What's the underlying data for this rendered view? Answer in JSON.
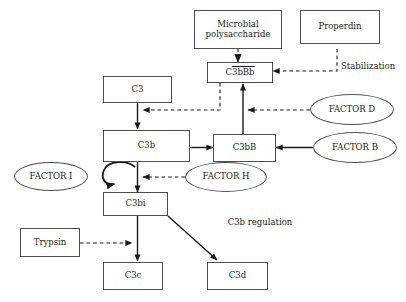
{
  "diagram": {
    "background_color": "#ffffff",
    "stroke_color": "#4d4d4d",
    "arrow_color": "#1a1a1a",
    "text_color": "#1a1a1a"
  },
  "nodes": {
    "microbial_polysaccharide": {
      "label_line1": "Microbial",
      "label_line2": "polysaccharide",
      "shape": "box"
    },
    "properdin": {
      "label": "Properdin",
      "shape": "box"
    },
    "c3bbb": {
      "label_prefix": "C",
      "label_overline": "3bBb",
      "shape": "box"
    },
    "c3": {
      "label": "C3",
      "shape": "box"
    },
    "c3b": {
      "label": "C3b",
      "shape": "box"
    },
    "c3bb": {
      "label": "C3bB",
      "shape": "box"
    },
    "c3bi": {
      "label": "C3bi",
      "shape": "box"
    },
    "trypsin": {
      "label": "Trypsin",
      "shape": "box"
    },
    "c3c": {
      "label": "C3c",
      "shape": "box"
    },
    "c3d": {
      "label": "C3d",
      "shape": "box"
    },
    "factor_d": {
      "label": "FACTOR D",
      "shape": "ellipse"
    },
    "factor_b": {
      "label": "FACTOR B",
      "shape": "ellipse"
    },
    "factor_h": {
      "label": "FACTOR H",
      "shape": "ellipse"
    },
    "factor_i": {
      "label": "FACTOR I",
      "shape": "ellipse"
    }
  },
  "annotations": {
    "stabilization": "Stabilization",
    "c3b_regulation": "C3b regulation"
  },
  "edges": [
    {
      "name": "microbial-to-c3bbb",
      "from": "microbial_polysaccharide",
      "to": "c3bbb",
      "style": "dashed"
    },
    {
      "name": "properdin-to-c3bbb",
      "from": "properdin",
      "to": "c3bbb",
      "style": "dashed",
      "label": "Stabilization"
    },
    {
      "name": "c3bbb-to-c3-c3b-arrow",
      "from": "c3bbb",
      "to": "c3b",
      "style": "dashed"
    },
    {
      "name": "c3-to-c3b",
      "from": "c3",
      "to": "c3b",
      "style": "solid"
    },
    {
      "name": "c3b-to-c3bb",
      "from": "c3b",
      "to": "c3bb",
      "style": "solid"
    },
    {
      "name": "c3bb-to-c3bbb",
      "from": "c3bb",
      "to": "c3bbb",
      "style": "solid"
    },
    {
      "name": "factor-d-to-c3bb-c3bbb",
      "from": "factor_d",
      "to": "c3bb_c3bbb_link",
      "style": "dashed"
    },
    {
      "name": "factor-b-to-c3bb",
      "from": "factor_b",
      "to": "c3bb",
      "style": "solid"
    },
    {
      "name": "c3b-to-c3bi",
      "from": "c3b",
      "to": "c3bi",
      "style": "solid"
    },
    {
      "name": "factor-h-to-c3b-c3bi",
      "from": "factor_h",
      "to": "c3b_c3bi_link",
      "style": "dashed"
    },
    {
      "name": "factor-i-loop",
      "from": "c3b_c3bi_link",
      "to": "factor_i",
      "style": "solid-curved"
    },
    {
      "name": "c3bi-to-c3c",
      "from": "c3bi",
      "to": "c3c",
      "style": "solid"
    },
    {
      "name": "c3bi-to-c3d",
      "from": "c3bi",
      "to": "c3d",
      "style": "solid"
    },
    {
      "name": "trypsin-to-c3bi-c3c",
      "from": "trypsin",
      "to": "c3bi_c3c_link",
      "style": "dashed"
    }
  ]
}
